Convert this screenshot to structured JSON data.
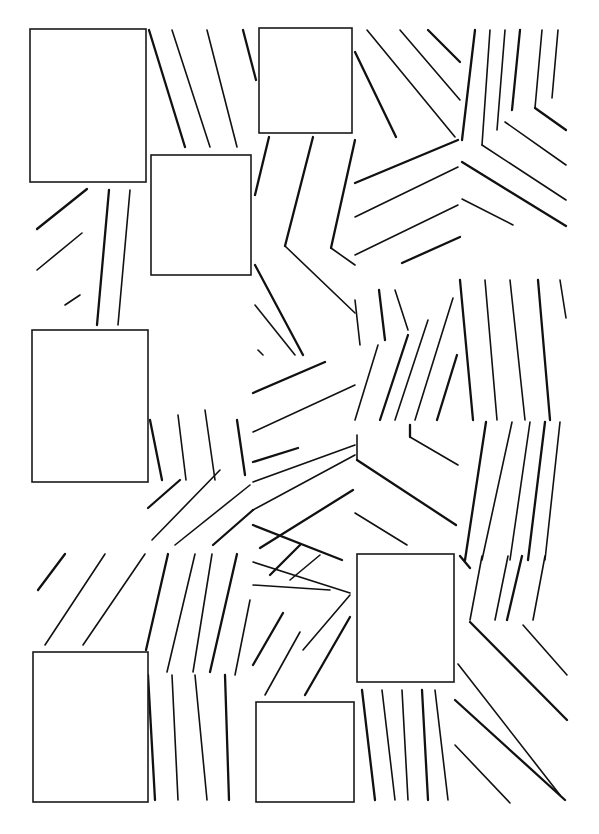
{
  "figure": {
    "background": "#ffffff",
    "stroke_color": "#111111",
    "width": 599,
    "height": 834
  },
  "rectangles": [
    {
      "id": "rect-1",
      "x": 30,
      "y": 29,
      "w": 116,
      "h": 153
    },
    {
      "id": "rect-2",
      "x": 151,
      "y": 155,
      "w": 100,
      "h": 120
    },
    {
      "id": "rect-3",
      "x": 259,
      "y": 28,
      "w": 93,
      "h": 105
    },
    {
      "id": "rect-4",
      "x": 32,
      "y": 330,
      "w": 116,
      "h": 152
    },
    {
      "id": "rect-5",
      "x": 357,
      "y": 554,
      "w": 97,
      "h": 128
    },
    {
      "id": "rect-6",
      "x": 33,
      "y": 652,
      "w": 115,
      "h": 150
    },
    {
      "id": "rect-7",
      "x": 256,
      "y": 702,
      "w": 98,
      "h": 100
    }
  ],
  "line_groups": [
    {
      "name": "top-left-diagonals",
      "lines": [
        [
          149,
          30,
          185,
          147
        ],
        [
          172,
          30,
          210,
          147
        ],
        [
          207,
          30,
          237,
          147
        ],
        [
          243,
          30,
          256,
          80
        ]
      ]
    },
    {
      "name": "left-mid-diagonals",
      "lines": [
        [
          37,
          229,
          87,
          189
        ],
        [
          37,
          270,
          82,
          233
        ],
        [
          65,
          305,
          80,
          295
        ]
      ]
    },
    {
      "name": "left-mid-verticals",
      "lines": [
        [
          109,
          190,
          97,
          325
        ],
        [
          130,
          190,
          118,
          325
        ]
      ]
    },
    {
      "name": "center-upper-vertical-1",
      "lines": [
        [
          269,
          137,
          255,
          195
        ]
      ]
    },
    {
      "name": "center-chevron-1",
      "lines": [
        [
          313,
          137,
          285,
          246
        ],
        [
          285,
          246,
          355,
          313
        ]
      ]
    },
    {
      "name": "center-chevron-2",
      "lines": [
        [
          355,
          140,
          331,
          248
        ],
        [
          331,
          248,
          355,
          265
        ]
      ]
    },
    {
      "name": "right-top-diagonals",
      "lines": [
        [
          355,
          52,
          396,
          137
        ],
        [
          367,
          30,
          455,
          137
        ],
        [
          400,
          30,
          460,
          100
        ],
        [
          428,
          30,
          460,
          62
        ]
      ]
    },
    {
      "name": "right-top-chevron-lines",
      "lines": [
        [
          355,
          183,
          458,
          140
        ],
        [
          355,
          217,
          458,
          167
        ],
        [
          355,
          255,
          458,
          205
        ],
        [
          402,
          263,
          460,
          237
        ]
      ]
    },
    {
      "name": "far-right-verticals-top",
      "lines": [
        [
          475,
          30,
          462,
          140
        ],
        [
          490,
          30,
          482,
          145
        ],
        [
          505,
          30,
          497,
          130
        ],
        [
          520,
          30,
          512,
          110
        ],
        [
          542,
          30,
          535,
          108
        ],
        [
          558,
          30,
          552,
          98
        ]
      ]
    },
    {
      "name": "far-right-chevrons",
      "lines": [
        [
          535,
          108,
          566,
          130
        ],
        [
          505,
          122,
          566,
          165
        ],
        [
          482,
          145,
          566,
          200
        ],
        [
          462,
          162,
          566,
          226
        ],
        [
          462,
          199,
          513,
          225
        ]
      ]
    },
    {
      "name": "center-left-diagonals",
      "lines": [
        [
          255,
          265,
          303,
          355
        ],
        [
          255,
          305,
          295,
          355
        ],
        [
          258,
          350,
          263,
          355
        ]
      ]
    },
    {
      "name": "center-mid-diagonals",
      "lines": [
        [
          253,
          393,
          325,
          362
        ],
        [
          253,
          432,
          355,
          385
        ],
        [
          355,
          300,
          360,
          345
        ]
      ]
    },
    {
      "name": "center-right-verticals",
      "lines": [
        [
          379,
          290,
          385,
          340
        ],
        [
          395,
          290,
          408,
          330
        ],
        [
          378,
          345,
          355,
          420
        ],
        [
          408,
          335,
          380,
          420
        ],
        [
          428,
          320,
          395,
          420
        ],
        [
          453,
          298,
          415,
          420
        ],
        [
          457,
          355,
          437,
          420
        ]
      ]
    },
    {
      "name": "mid-right-verticals",
      "lines": [
        [
          460,
          280,
          473,
          420
        ],
        [
          485,
          280,
          497,
          420
        ],
        [
          510,
          280,
          525,
          420
        ],
        [
          538,
          280,
          550,
          420
        ],
        [
          560,
          280,
          566,
          318
        ]
      ]
    },
    {
      "name": "mid-left-verticals",
      "lines": [
        [
          150,
          420,
          162,
          480
        ],
        [
          178,
          415,
          186,
          480
        ],
        [
          205,
          410,
          215,
          480
        ],
        [
          237,
          420,
          245,
          475
        ]
      ]
    },
    {
      "name": "mid-chevron-lower-left",
      "lines": [
        [
          148,
          508,
          180,
          480
        ],
        [
          152,
          540,
          220,
          470
        ],
        [
          175,
          545,
          250,
          485
        ],
        [
          213,
          545,
          253,
          510
        ]
      ]
    },
    {
      "name": "mid-center-diagonals",
      "lines": [
        [
          253,
          462,
          298,
          448
        ],
        [
          253,
          482,
          355,
          445
        ],
        [
          253,
          510,
          355,
          455
        ],
        [
          260,
          548,
          353,
          490
        ]
      ]
    },
    {
      "name": "mid-center-fan",
      "lines": [
        [
          253,
          525,
          342,
          560
        ],
        [
          253,
          562,
          350,
          593
        ],
        [
          253,
          585,
          330,
          590
        ],
        [
          270,
          575,
          300,
          545
        ],
        [
          290,
          580,
          320,
          555
        ]
      ]
    },
    {
      "name": "mid-right-chevrons",
      "lines": [
        [
          410,
          425,
          410,
          437
        ],
        [
          410,
          437,
          458,
          465
        ],
        [
          357,
          435,
          357,
          460
        ],
        [
          357,
          460,
          456,
          525
        ],
        [
          355,
          513,
          407,
          545
        ]
      ]
    },
    {
      "name": "far-right-verticals-mid",
      "lines": [
        [
          486,
          422,
          465,
          560
        ],
        [
          512,
          422,
          482,
          560
        ],
        [
          530,
          422,
          510,
          560
        ],
        [
          545,
          422,
          528,
          560
        ],
        [
          560,
          422,
          545,
          560
        ]
      ]
    },
    {
      "name": "far-right-diagonals-bottom",
      "lines": [
        [
          470,
          622,
          567,
          720
        ],
        [
          523,
          625,
          567,
          675
        ],
        [
          458,
          664,
          560,
          795
        ],
        [
          455,
          700,
          565,
          800
        ],
        [
          455,
          745,
          510,
          803
        ]
      ]
    },
    {
      "name": "bottom-left-diagonals",
      "lines": [
        [
          38,
          590,
          65,
          554
        ],
        [
          45,
          645,
          105,
          554
        ],
        [
          83,
          645,
          145,
          554
        ]
      ]
    },
    {
      "name": "bottom-center-verticals",
      "lines": [
        [
          168,
          554,
          146,
          650
        ],
        [
          195,
          554,
          167,
          672
        ],
        [
          212,
          554,
          193,
          672
        ],
        [
          237,
          554,
          210,
          672
        ],
        [
          250,
          600,
          235,
          675
        ]
      ]
    },
    {
      "name": "bottom-center-lines",
      "lines": [
        [
          148,
          675,
          155,
          800
        ],
        [
          172,
          675,
          178,
          800
        ],
        [
          195,
          675,
          207,
          800
        ],
        [
          225,
          675,
          229,
          800
        ]
      ]
    },
    {
      "name": "bottom-center-diagonals",
      "lines": [
        [
          253,
          665,
          283,
          613
        ],
        [
          265,
          695,
          300,
          632
        ],
        [
          350,
          595,
          303,
          650
        ],
        [
          350,
          617,
          305,
          695
        ]
      ]
    },
    {
      "name": "bottom-right-verticals",
      "lines": [
        [
          362,
          690,
          375,
          800
        ],
        [
          382,
          690,
          395,
          800
        ],
        [
          402,
          690,
          408,
          800
        ],
        [
          422,
          690,
          428,
          800
        ],
        [
          435,
          690,
          448,
          800
        ]
      ]
    },
    {
      "name": "right-bottom-verticals",
      "lines": [
        [
          460,
          556,
          470,
          568
        ],
        [
          482,
          556,
          470,
          620
        ],
        [
          508,
          556,
          495,
          620
        ],
        [
          522,
          556,
          507,
          620
        ],
        [
          545,
          556,
          533,
          620
        ]
      ]
    }
  ]
}
